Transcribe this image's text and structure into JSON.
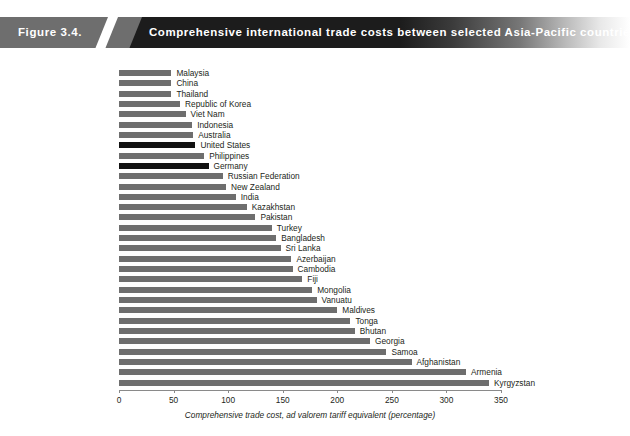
{
  "header": {
    "figure_number": "Figure 3.4.",
    "title": "Comprehensive international trade costs between selected Asia-Pacific countries and Japan",
    "tag_color": "#6e6e6e",
    "band_color": "#1c1c1c",
    "text_color": "#ffffff"
  },
  "chart_data": {
    "type": "bar",
    "orientation": "horizontal",
    "title": "Comprehensive international trade costs between selected Asia-Pacific countries and Japan",
    "xlabel": "Comprehensive trade cost, ad valorem tariff equivalent (percentage)",
    "ylabel": "",
    "xlim": [
      0,
      350
    ],
    "xticks": [
      0,
      50,
      100,
      150,
      200,
      250,
      300,
      350
    ],
    "grid": false,
    "legend": "none",
    "bar_color": "#6e6e6e",
    "highlight_color": "#111111",
    "highlight_categories": [
      "United States",
      "Germany"
    ],
    "categories": [
      "Malaysia",
      "China",
      "Thailand",
      "Republic of Korea",
      "Viet Nam",
      "Indonesia",
      "Australia",
      "United States",
      "Philippines",
      "Germany",
      "Russian Federation",
      "New Zealand",
      "India",
      "Kazakhstan",
      "Pakistan",
      "Turkey",
      "Bangladesh",
      "Sri Lanka",
      "Azerbaijan",
      "Cambodia",
      "Fiji",
      "Mongolia",
      "Vanuatu",
      "Maldives",
      "Tonga",
      "Bhutan",
      "Georgia",
      "Samoa",
      "Afghanistan",
      "Armenia",
      "Kyrgyzstan"
    ],
    "values": [
      48,
      48,
      48,
      56,
      61,
      67,
      68,
      70,
      78,
      82,
      95,
      98,
      107,
      117,
      125,
      140,
      144,
      148,
      158,
      159,
      168,
      177,
      181,
      200,
      212,
      216,
      230,
      245,
      268,
      318,
      339
    ]
  }
}
